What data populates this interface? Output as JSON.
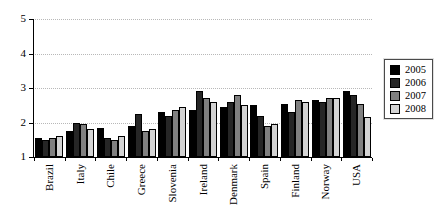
{
  "chart_data": {
    "type": "bar",
    "title": "",
    "xlabel": "",
    "ylabel": "",
    "categories": [
      "Brazil",
      "Italy",
      "Chile",
      "Greece",
      "Slovenia",
      "Ireland",
      "Denmark",
      "Spain",
      "Finland",
      "Norway",
      "USA"
    ],
    "series": [
      {
        "name": "2005",
        "color": "#000000",
        "values": [
          1.55,
          1.75,
          1.85,
          1.9,
          2.3,
          2.35,
          2.45,
          2.5,
          2.55,
          2.65,
          2.9
        ]
      },
      {
        "name": "2006",
        "color": "#262626",
        "values": [
          1.5,
          2.0,
          1.55,
          2.25,
          2.2,
          2.9,
          2.6,
          2.2,
          2.3,
          2.6,
          2.8
        ]
      },
      {
        "name": "2007",
        "color": "#808080",
        "values": [
          1.55,
          1.95,
          1.5,
          1.75,
          2.35,
          2.7,
          2.8,
          1.9,
          2.65,
          2.7,
          2.55
        ]
      },
      {
        "name": "2008",
        "color": "#d3d3d3",
        "values": [
          1.6,
          1.8,
          1.6,
          1.8,
          2.45,
          2.6,
          2.5,
          1.95,
          2.6,
          2.7,
          2.15
        ]
      }
    ],
    "ylim": [
      1,
      5
    ],
    "yticks": [
      "1",
      "2",
      "3",
      "4",
      "5"
    ],
    "grid": "horizontal dotted lines at 2, 3, 4, 5",
    "legend_position": "right",
    "legend_entries": [
      "2005",
      "2006",
      "2007",
      "2008"
    ]
  }
}
